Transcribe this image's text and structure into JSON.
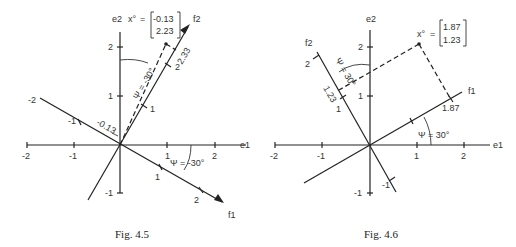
{
  "figures": [
    {
      "caption": "Fig. 4.5",
      "axes": {
        "e1_label": "e1",
        "e2_label": "e2",
        "f1_label": "f1",
        "f2_label": "f2"
      },
      "e1_ticks": [
        "-2",
        "-1",
        "1",
        "2"
      ],
      "e2_ticks": [
        "2",
        "1",
        "-1"
      ],
      "f1_ticks": [
        "1",
        "2"
      ],
      "f2_ticks": [
        "1",
        "2",
        "-1",
        "-2"
      ],
      "angle_labels": [
        "Ψ = -30°",
        "Ψ = -30°"
      ],
      "point_label": "x°",
      "vector": [
        "-0.13",
        "2.23"
      ],
      "projection_labels": [
        "-0.13",
        "2.33"
      ]
    },
    {
      "caption": "Fig. 4.6",
      "axes": {
        "e1_label": "e1",
        "e2_label": "e2",
        "f1_label": "f1",
        "f2_label": "f2"
      },
      "e1_ticks": [
        "-2",
        "-1",
        "1",
        "2"
      ],
      "e2_ticks": [
        "2",
        "1",
        "-1"
      ],
      "f1_ticks": [
        "1.87"
      ],
      "f2_ticks": [
        "2",
        "1",
        "-1"
      ],
      "angle_labels": [
        "Ψ = 30°",
        "Ψ = 30°"
      ],
      "point_label": "x°",
      "vector": [
        "1.87",
        "1.23"
      ],
      "projection_labels": [
        "1.87",
        "1.23"
      ]
    }
  ]
}
